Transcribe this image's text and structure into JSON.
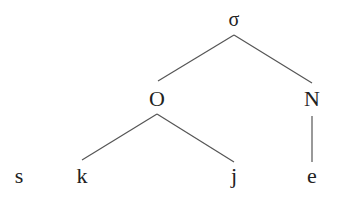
{
  "diagram": {
    "type": "syllable-tree",
    "nodes": [
      {
        "id": "sigma",
        "label": "σ",
        "x": 234,
        "y": 26,
        "size": 20
      },
      {
        "id": "onset",
        "label": "O",
        "x": 157,
        "y": 106,
        "size": 22
      },
      {
        "id": "nucleus",
        "label": "N",
        "x": 312,
        "y": 106,
        "size": 22
      },
      {
        "id": "s",
        "label": "s",
        "x": 19,
        "y": 183,
        "size": 22
      },
      {
        "id": "k",
        "label": "k",
        "x": 82,
        "y": 183,
        "size": 22
      },
      {
        "id": "j",
        "label": "j",
        "x": 234,
        "y": 183,
        "size": 22
      },
      {
        "id": "e",
        "label": "e",
        "x": 312,
        "y": 183,
        "size": 22
      }
    ],
    "edges": [
      {
        "from": "sigma",
        "to": "onset",
        "x1": 234,
        "y1": 35,
        "x2": 158,
        "y2": 81
      },
      {
        "from": "sigma",
        "to": "nucleus",
        "x1": 234,
        "y1": 35,
        "x2": 312,
        "y2": 83
      },
      {
        "from": "onset",
        "to": "k",
        "x1": 157,
        "y1": 114,
        "x2": 82,
        "y2": 160
      },
      {
        "from": "onset",
        "to": "j",
        "x1": 157,
        "y1": 114,
        "x2": 234,
        "y2": 162
      },
      {
        "from": "nucleus",
        "to": "e",
        "x1": 312,
        "y1": 116,
        "x2": 312,
        "y2": 162
      }
    ],
    "colors": {
      "text": "#222222",
      "edge": "#555555",
      "background": "#ffffff"
    }
  }
}
